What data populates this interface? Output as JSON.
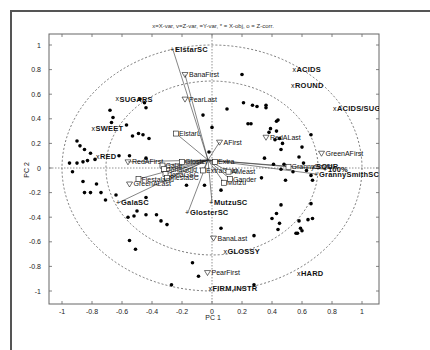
{
  "chart_data": {
    "type": "scatter",
    "title": "x=X-var, v=Z-var, =Y-var, * = X-obj, o = Z-corr.",
    "xlabel": "PC 1",
    "ylabel": "PC 2",
    "xlim": [
      -1.1,
      1.1
    ],
    "ylim": [
      -1.1,
      1.1
    ],
    "xticks": [
      -1,
      -0.8,
      -0.6,
      -0.4,
      -0.2,
      0,
      0.2,
      0.4,
      0.6,
      0.8,
      1
    ],
    "yticks": [
      -1,
      -0.8,
      -0.6,
      -0.4,
      -0.2,
      0,
      0.2,
      0.4,
      0.6,
      0.8,
      1
    ],
    "grid": false,
    "reference_circles": [
      1.0,
      0.707
    ],
    "zero_lines": true,
    "x_variables": [
      {
        "label": "SUGARS",
        "x": -0.63,
        "y": 0.56
      },
      {
        "label": "SWEET",
        "x": -0.79,
        "y": 0.32
      },
      {
        "label": "RED",
        "x": -0.76,
        "y": 0.09
      },
      {
        "label": "ACIDS",
        "x": 0.55,
        "y": 0.8
      },
      {
        "label": "ROUND",
        "x": 0.54,
        "y": 0.67
      },
      {
        "label": "ACIDS/SUGARS",
        "x": 0.82,
        "y": 0.48
      },
      {
        "label": "SOUR",
        "x": 0.68,
        "y": 0.01
      },
      {
        "label": "GLOSSY",
        "x": 0.09,
        "y": -0.68
      },
      {
        "label": "FIRM,INSTR",
        "x": -0.01,
        "y": -0.98
      },
      {
        "label": "HARD",
        "x": 0.58,
        "y": -0.86
      }
    ],
    "z_variables": [
      {
        "label": "BanaFirst",
        "x": -0.18,
        "y": 0.76
      },
      {
        "label": "PearLast",
        "x": -0.18,
        "y": 0.56
      },
      {
        "label": "RedAFirst",
        "x": -0.56,
        "y": 0.05
      },
      {
        "label": "GreenALast",
        "x": -0.55,
        "y": -0.13
      },
      {
        "label": "AFirst",
        "x": 0.05,
        "y": 0.21
      },
      {
        "label": "RedALast",
        "x": 0.36,
        "y": 0.25
      },
      {
        "label": "GreenAFirst",
        "x": 0.73,
        "y": 0.12
      },
      {
        "label": "BanaLast",
        "x": 0.01,
        "y": -0.57
      },
      {
        "label": "PearFirst",
        "x": -0.03,
        "y": -0.85
      }
    ],
    "y_variables": [
      {
        "label": "ElstarSC",
        "x": -0.26,
        "y": 0.96
      },
      {
        "label": "GalaSC",
        "x": -0.62,
        "y": -0.28
      },
      {
        "label": "GlosterSC",
        "x": -0.16,
        "y": -0.36
      },
      {
        "label": "MutzuSC",
        "x": 0.0,
        "y": -0.28
      },
      {
        "label": "GrannySmithSC",
        "x": 0.7,
        "y": -0.05
      },
      {
        "label": "100%",
        "x": 0.76,
        "y": -0.01
      }
    ],
    "z_correlations": [
      {
        "label": "ElstarL",
        "x": -0.24,
        "y": 0.28
      },
      {
        "label": "Galal",
        "x": -0.33,
        "y": 0.02
      },
      {
        "label": "JonaGold",
        "x": -0.32,
        "y": -0.01
      },
      {
        "label": "JonaGSC",
        "x": -0.31,
        "y": -0.05
      },
      {
        "label": "FiestaSC",
        "x": -0.3,
        "y": -0.08
      },
      {
        "label": "Fiestaland",
        "x": -0.49,
        "y": -0.09
      },
      {
        "label": "Gloster",
        "x": -0.2,
        "y": 0.05
      },
      {
        "label": "GrannySmith",
        "x": 0.51,
        "y": 0.01
      },
      {
        "label": "Mutzu",
        "x": 0.08,
        "y": -0.12
      },
      {
        "label": "ExtraGold",
        "x": -0.06,
        "y": -0.02
      },
      {
        "label": "Gander",
        "x": 0.12,
        "y": -0.09
      },
      {
        "label": "Extra",
        "x": 0.02,
        "y": 0.05
      },
      {
        "label": "AMeast",
        "x": 0.11,
        "y": -0.03
      }
    ],
    "x_objects": [
      [
        -0.95,
        0.04
      ],
      [
        -0.9,
        0.04
      ],
      [
        -0.86,
        0.05
      ],
      [
        -0.83,
        0.06
      ],
      [
        -0.78,
        0.07
      ],
      [
        -0.81,
        0.12
      ],
      [
        -0.85,
        0.15
      ],
      [
        -0.88,
        0.18
      ],
      [
        -0.9,
        0.22
      ],
      [
        -0.68,
        0.47
      ],
      [
        -0.66,
        0.41
      ],
      [
        -0.67,
        0.37
      ],
      [
        -0.48,
        0.56
      ],
      [
        -0.45,
        0.53
      ],
      [
        -0.44,
        0.49
      ],
      [
        -0.57,
        0.35
      ],
      [
        -0.53,
        0.26
      ],
      [
        -0.49,
        0.28
      ],
      [
        -0.46,
        0.27
      ],
      [
        -0.42,
        0.24
      ],
      [
        -0.62,
        0.1
      ],
      [
        -0.55,
        0.1
      ],
      [
        -0.93,
        -0.03
      ],
      [
        -0.86,
        -0.11
      ],
      [
        -0.81,
        -0.2
      ],
      [
        -0.85,
        -0.2
      ],
      [
        -0.77,
        -0.13
      ],
      [
        -0.74,
        -0.2
      ],
      [
        -0.71,
        -0.26
      ],
      [
        -0.64,
        -0.22
      ],
      [
        -0.56,
        -0.4
      ],
      [
        -0.52,
        -0.39
      ],
      [
        -0.5,
        -0.35
      ],
      [
        -0.44,
        -0.24
      ],
      [
        -0.44,
        -0.38
      ],
      [
        -0.34,
        -0.43
      ],
      [
        -0.37,
        -0.38
      ],
      [
        -0.3,
        -0.46
      ],
      [
        -0.27,
        -0.95
      ],
      [
        -0.55,
        -0.59
      ],
      [
        -0.51,
        -0.66
      ],
      [
        -0.09,
        -0.88
      ],
      [
        -0.13,
        -0.77
      ],
      [
        0.06,
        -0.49
      ],
      [
        0.1,
        0.48
      ],
      [
        -0.06,
        0.43
      ],
      [
        0.0,
        0.33
      ],
      [
        -0.44,
        0.08
      ],
      [
        -0.17,
        -0.14
      ],
      [
        -0.05,
        -0.14
      ],
      [
        -0.02,
        0.13
      ],
      [
        0.06,
        -0.18
      ],
      [
        0.2,
        0.76
      ],
      [
        0.21,
        0.53
      ],
      [
        0.27,
        0.51
      ],
      [
        0.3,
        0.5
      ],
      [
        0.24,
        0.36
      ],
      [
        0.26,
        0.36
      ],
      [
        0.36,
        0.51
      ],
      [
        0.36,
        0.49
      ],
      [
        0.43,
        0.38
      ],
      [
        0.44,
        0.39
      ],
      [
        0.39,
        0.32
      ],
      [
        0.38,
        0.29
      ],
      [
        0.43,
        0.3
      ],
      [
        0.42,
        0.23
      ],
      [
        0.46,
        0.15
      ],
      [
        0.47,
        0.2
      ],
      [
        0.45,
        0.24
      ],
      [
        0.35,
        0.08
      ],
      [
        0.41,
        0.03
      ],
      [
        0.48,
        0.03
      ],
      [
        0.6,
        0.17
      ],
      [
        0.66,
        0.27
      ],
      [
        0.58,
        0.09
      ],
      [
        0.61,
        0.04
      ],
      [
        0.54,
        -0.03
      ],
      [
        0.63,
        -0.02
      ],
      [
        0.66,
        -0.06
      ],
      [
        0.67,
        -0.1
      ],
      [
        0.46,
        -0.01
      ],
      [
        0.33,
        -0.08
      ],
      [
        0.49,
        -0.1
      ],
      [
        0.46,
        -0.3
      ],
      [
        0.43,
        -0.37
      ],
      [
        0.4,
        -0.41
      ],
      [
        0.45,
        -0.45
      ],
      [
        0.44,
        -0.5
      ],
      [
        0.56,
        -0.53
      ],
      [
        0.57,
        -0.53
      ],
      [
        0.64,
        -0.42
      ],
      [
        0.67,
        -0.41
      ],
      [
        0.58,
        -0.43
      ],
      [
        0.66,
        -0.29
      ],
      [
        0.28,
        -0.55
      ],
      [
        0.28,
        -0.95
      ],
      [
        0.6,
        -0.51
      ],
      [
        0.59,
        -0.49
      ]
    ]
  }
}
